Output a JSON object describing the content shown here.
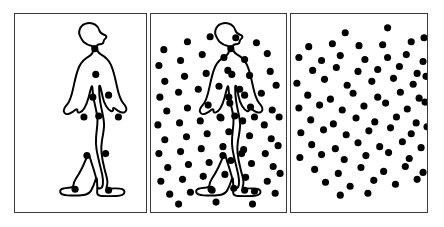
{
  "figure": {
    "width": 444,
    "height": 227,
    "background_color": "#ffffff",
    "panel_border_color": "#3a3a3a",
    "dot_color": "#000000",
    "outline_color": "#000000",
    "dot_radius": 3.6,
    "panel_count": 3
  },
  "panels": [
    {
      "id": "panel-walker-outline",
      "label": "Walker with joint dots",
      "x": 14,
      "y": 13,
      "width": 133,
      "height": 200,
      "show_outline": true,
      "show_joint_dots": true,
      "show_mask_dots": false,
      "mask_dot_count": 0
    },
    {
      "id": "panel-walker-in-mask",
      "label": "Walker embedded in dot mask",
      "x": 150,
      "y": 13,
      "width": 137,
      "height": 200,
      "show_outline": true,
      "show_joint_dots": true,
      "show_mask_dots": true,
      "mask_dot_count": 72
    },
    {
      "id": "panel-mask-only",
      "label": "Dot mask only",
      "x": 290,
      "y": 13,
      "width": 138,
      "height": 200,
      "show_outline": false,
      "show_joint_dots": false,
      "show_mask_dots": true,
      "mask_dot_count": 74
    }
  ],
  "walker": {
    "description": "Side-view human figure walking to the right, left leg forward",
    "outline_path": "M 66.5 23.2 C 63.0 17.0 66.8 10.4 73.4 9.3 C 79.6 8.2 84.5 12.0 85.6 16.4 C 86.4 19.6 88.4 20.2 90.6 21.0 C 93.0 21.8 93.6 23.6 91.6 25.0 C 89.4 26.5 90.4 28.0 89.4 29.4 C 88.4 30.8 86.4 30.4 84.6 30.8 C 83.4 31.1 83.0 32.6 83.2 34.6 C 83.4 37.1 84.0 39.0 86.8 40.6 C 91.6 43.3 95.0 46.2 97.4 51.4 C 100.2 57.6 101.8 65.0 103.4 72.8 C 105.0 80.5 106.8 86.6 109.8 90.0 C 112.2 92.7 113.6 94.6 113.0 97.0 C 112.4 99.4 110.2 100.0 107.6 99.2 C 105.0 98.4 102.8 96.6 101.4 95.4 C 100.2 94.4 99.2 94.8 99.6 96.2 C 100.0 97.6 99.0 98.6 97.4 98.0 C 95.8 97.4 94.0 95.4 92.6 93.2 C 90.8 90.4 89.6 87.0 88.8 83.0 C 88.0 79.2 87.4 76.0 86.6 73.6 C 86.0 71.8 85.4 72.0 85.4 74.0 C 85.4 78.0 85.6 83.0 86.4 88.0 C 87.2 93.2 88.2 97.6 89.0 101.4 C 89.8 105.4 90.6 109.0 90.4 113.0 C 90.2 118.0 89.0 123.4 88.2 128.6 C 87.6 132.6 87.4 136.0 87.8 140.0 C 88.4 146.0 89.6 151.6 91.0 157.0 C 92.4 162.4 93.6 166.0 93.8 169.0 C 94.0 171.8 93.4 173.4 93.0 174.8 C 92.6 176.2 93.6 176.6 96.0 176.4 C 99.6 176.1 103.4 176.0 106.6 176.4 C 110.0 176.8 111.6 178.4 111.0 180.6 C 110.4 182.8 107.4 183.6 103.0 183.8 C 98.0 184.0 92.4 184.0 88.0 183.8 C 84.8 183.7 83.4 182.8 83.4 180.4 C 83.4 177.4 83.8 174.4 83.4 171.0 C 83.0 167.4 81.8 163.4 80.4 158.8 C 78.8 153.6 77.0 148.4 75.8 144.0 C 75.0 141.0 74.2 141.4 73.2 143.8 C 71.6 147.6 69.8 152.0 67.8 156.0 C 65.6 160.4 63.6 163.6 61.8 166.4 C 60.2 168.9 59.4 170.4 59.4 172.4 C 59.4 174.2 58.6 175.0 56.6 175.2 C 54.0 175.5 51.2 175.6 49.0 176.2 C 46.6 176.9 45.4 178.2 46.0 180.2 C 46.6 182.2 49.2 183.0 53.4 183.2 C 58.6 183.5 64.6 183.4 69.6 182.8 C 73.6 182.3 75.6 181.0 77.2 178.4 C 79.0 175.4 80.4 172.0 81.6 168.0 C 82.4 165.3 83.0 165.4 83.2 167.0 C 83.4 169.0 83.4 171.0 83.4 173.0 C 83.4 175.2 84.2 176.2 85.8 176.2 C 87.8 176.2 88.8 175.0 89.2 172.4 C 89.6 169.6 89.4 166.4 88.6 162.6 C 87.4 157.0 85.8 151.0 84.4 145.0 C 83.2 140.0 82.4 135.6 82.2 131.0 C 82.0 126.4 82.4 122.0 83.0 117.4 C 83.6 112.6 84.0 108.6 83.6 104.6 C 83.2 100.4 82.2 96.4 81.2 92.0 C 80.0 86.8 79.0 81.6 78.8 76.6 C 78.6 72.2 78.2 72.0 77.4 74.4 C 76.4 77.4 75.6 81.0 74.6 84.6 C 73.4 89.0 72.0 92.6 70.4 95.2 C 69.0 97.4 67.4 99.0 65.8 99.4 C 64.2 99.8 63.2 99.0 63.4 97.6 C 63.6 96.2 62.6 95.8 61.4 96.8 C 59.8 98.2 57.6 100.0 55.0 100.8 C 52.4 101.6 50.2 101.0 49.6 98.6 C 49.0 96.2 50.4 94.3 52.8 91.6 C 55.8 88.2 57.6 82.1 59.2 74.4 C 60.8 66.6 62.4 59.2 65.2 53.0 C 67.6 47.8 71.0 44.9 75.8 42.2 C 78.6 40.6 79.2 38.7 79.4 36.2 C 79.6 34.2 79.2 32.7 78.0 32.4 C 75.4 31.8 72.2 30.4 69.8 28.2 C 67.8 26.4 67.4 24.8 66.5 23.2 Z",
    "joint_dots": [
      {
        "name": "head",
        "x": 81,
        "y": 35
      },
      {
        "name": "neck-sternum",
        "x": 82,
        "y": 61
      },
      {
        "name": "shoulder-far",
        "x": 79,
        "y": 84
      },
      {
        "name": "shoulder-near",
        "x": 95,
        "y": 82
      },
      {
        "name": "hand-far",
        "x": 70,
        "y": 104
      },
      {
        "name": "pelvis",
        "x": 85,
        "y": 103
      },
      {
        "name": "hand-near",
        "x": 105,
        "y": 104
      },
      {
        "name": "knee-far",
        "x": 73,
        "y": 143
      },
      {
        "name": "knee-near",
        "x": 92,
        "y": 141
      },
      {
        "name": "foot-far",
        "x": 61,
        "y": 177
      },
      {
        "name": "foot-near",
        "x": 95,
        "y": 178
      }
    ]
  },
  "mask_dots": {
    "panel_walker_in_mask": [
      [
        13,
        36
      ],
      [
        37,
        28
      ],
      [
        60,
        23
      ],
      [
        86,
        24
      ],
      [
        107,
        29
      ],
      [
        8,
        52
      ],
      [
        30,
        47
      ],
      [
        52,
        41
      ],
      [
        74,
        44
      ],
      [
        95,
        46
      ],
      [
        118,
        40
      ],
      [
        14,
        68
      ],
      [
        34,
        63
      ],
      [
        56,
        60
      ],
      [
        78,
        57
      ],
      [
        100,
        62
      ],
      [
        121,
        58
      ],
      [
        9,
        84
      ],
      [
        28,
        79
      ],
      [
        48,
        76
      ],
      [
        69,
        73
      ],
      [
        90,
        76
      ],
      [
        112,
        80
      ],
      [
        127,
        72
      ],
      [
        16,
        98
      ],
      [
        37,
        95
      ],
      [
        58,
        92
      ],
      [
        80,
        90
      ],
      [
        101,
        94
      ],
      [
        123,
        97
      ],
      [
        7,
        112
      ],
      [
        29,
        110
      ],
      [
        50,
        108
      ],
      [
        71,
        105
      ],
      [
        93,
        108
      ],
      [
        115,
        112
      ],
      [
        130,
        104
      ],
      [
        14,
        127
      ],
      [
        36,
        124
      ],
      [
        57,
        121
      ],
      [
        79,
        119
      ],
      [
        100,
        123
      ],
      [
        122,
        126
      ],
      [
        8,
        141
      ],
      [
        30,
        139
      ],
      [
        51,
        136
      ],
      [
        73,
        134
      ],
      [
        94,
        137
      ],
      [
        116,
        141
      ],
      [
        129,
        133
      ],
      [
        17,
        155
      ],
      [
        38,
        152
      ],
      [
        59,
        150
      ],
      [
        81,
        148
      ],
      [
        102,
        151
      ],
      [
        124,
        154
      ],
      [
        10,
        169
      ],
      [
        32,
        167
      ],
      [
        53,
        164
      ],
      [
        75,
        162
      ],
      [
        96,
        165
      ],
      [
        118,
        169
      ],
      [
        131,
        161
      ],
      [
        19,
        182
      ],
      [
        40,
        180
      ],
      [
        62,
        178
      ],
      [
        84,
        176
      ],
      [
        105,
        179
      ],
      [
        126,
        181
      ],
      [
        28,
        192
      ],
      [
        66,
        190
      ],
      [
        103,
        192
      ]
    ],
    "panel_mask_only": [
      [
        55,
        19
      ],
      [
        98,
        14
      ],
      [
        135,
        24
      ],
      [
        18,
        33
      ],
      [
        42,
        30
      ],
      [
        69,
        32
      ],
      [
        93,
        31
      ],
      [
        122,
        28
      ],
      [
        8,
        44
      ],
      [
        31,
        47
      ],
      [
        50,
        42
      ],
      [
        75,
        46
      ],
      [
        98,
        44
      ],
      [
        117,
        41
      ],
      [
        134,
        48
      ],
      [
        22,
        57
      ],
      [
        46,
        54
      ],
      [
        68,
        58
      ],
      [
        88,
        56
      ],
      [
        110,
        53
      ],
      [
        128,
        60
      ],
      [
        6,
        70
      ],
      [
        34,
        66
      ],
      [
        57,
        72
      ],
      [
        82,
        68
      ],
      [
        104,
        65
      ],
      [
        124,
        71
      ],
      [
        137,
        63
      ],
      [
        17,
        82
      ],
      [
        40,
        86
      ],
      [
        63,
        80
      ],
      [
        88,
        84
      ],
      [
        111,
        79
      ],
      [
        130,
        85
      ],
      [
        8,
        95
      ],
      [
        29,
        92
      ],
      [
        52,
        97
      ],
      [
        74,
        93
      ],
      [
        96,
        90
      ],
      [
        118,
        96
      ],
      [
        136,
        89
      ],
      [
        20,
        107
      ],
      [
        43,
        111
      ],
      [
        66,
        105
      ],
      [
        85,
        109
      ],
      [
        107,
        104
      ],
      [
        127,
        110
      ],
      [
        10,
        120
      ],
      [
        33,
        117
      ],
      [
        56,
        122
      ],
      [
        79,
        118
      ],
      [
        101,
        115
      ],
      [
        122,
        121
      ],
      [
        138,
        114
      ],
      [
        21,
        132
      ],
      [
        45,
        136
      ],
      [
        68,
        130
      ],
      [
        90,
        134
      ],
      [
        113,
        129
      ],
      [
        132,
        135
      ],
      [
        9,
        145
      ],
      [
        31,
        142
      ],
      [
        54,
        147
      ],
      [
        76,
        143
      ],
      [
        99,
        140
      ],
      [
        120,
        146
      ],
      [
        24,
        157
      ],
      [
        48,
        161
      ],
      [
        71,
        155
      ],
      [
        94,
        159
      ],
      [
        116,
        154
      ],
      [
        134,
        160
      ],
      [
        35,
        170
      ],
      [
        60,
        174
      ],
      [
        84,
        168
      ],
      [
        106,
        172
      ],
      [
        128,
        167
      ],
      [
        50,
        183
      ],
      [
        78,
        181
      ]
    ]
  }
}
